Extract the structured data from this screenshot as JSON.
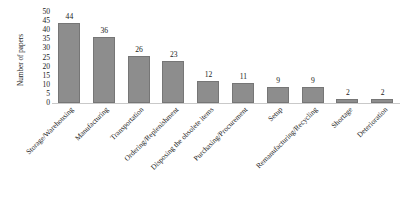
{
  "chart_data": {
    "type": "bar",
    "title": "",
    "xlabel": "",
    "ylabel": "Number of papers",
    "ylim": [
      0,
      50
    ],
    "yticks": [
      50,
      45,
      40,
      35,
      30,
      25,
      20,
      15,
      10,
      5,
      0
    ],
    "grid": false,
    "legend": false,
    "bar_color": "#8d8d8d",
    "bar_border_color": "#767676",
    "categories": [
      "Storage/Warehousing",
      "Manufacturing",
      "Transportation",
      "Ordering/Replenishment",
      "Disposing the obsolete items",
      "Purchasing/Procurement",
      "Setup",
      "Remanufacturing/Recycling",
      "Shortage",
      "Deterioration"
    ],
    "values": [
      44,
      36,
      26,
      23,
      12,
      11,
      9,
      9,
      2,
      2
    ],
    "data_labels": [
      "44",
      "36",
      "26",
      "23",
      "12",
      "11",
      "9",
      "9",
      "2",
      "2"
    ]
  },
  "caption": {
    "number": "",
    "text": ""
  }
}
